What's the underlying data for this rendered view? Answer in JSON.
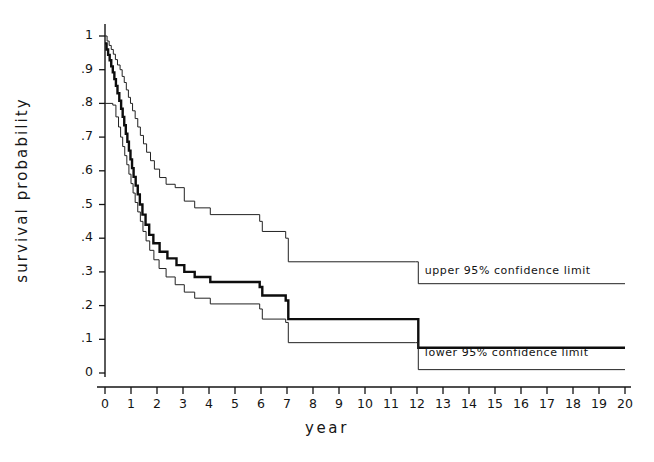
{
  "chart_data": {
    "type": "line",
    "title": "",
    "xlabel": "year",
    "ylabel": "survival probability",
    "xlim": [
      0,
      20
    ],
    "ylim": [
      0,
      1
    ],
    "grid": false,
    "legend_position": "inline-annotations",
    "x_ticks": [
      "0",
      "1",
      "2",
      "3",
      "4",
      "5",
      "6",
      "7",
      "8",
      "9",
      "10",
      "11",
      "12",
      "13",
      "14",
      "15",
      "16",
      "17",
      "18",
      "19",
      "20"
    ],
    "y_ticks": [
      "0",
      ".1",
      ".2",
      ".3",
      ".4",
      ".5",
      ".6",
      ".7",
      ".8",
      ".9",
      "1"
    ],
    "annotations": [
      {
        "text": "upper 95% confidence limit",
        "x": 12.3,
        "y": 0.3
      },
      {
        "text": "lower 95% confidence limit",
        "x": 12.3,
        "y": 0.055
      }
    ],
    "series": [
      {
        "name": "upper 95% confidence limit",
        "style": "step",
        "linewidth": 1,
        "color": "#222222",
        "points": [
          [
            0.0,
            1.0
          ],
          [
            0.08,
            0.985
          ],
          [
            0.16,
            0.972
          ],
          [
            0.24,
            0.96
          ],
          [
            0.32,
            0.946
          ],
          [
            0.4,
            0.93
          ],
          [
            0.48,
            0.914
          ],
          [
            0.58,
            0.9
          ],
          [
            0.66,
            0.88
          ],
          [
            0.74,
            0.862
          ],
          [
            0.82,
            0.84
          ],
          [
            0.9,
            0.818
          ],
          [
            0.98,
            0.8
          ],
          [
            1.06,
            0.778
          ],
          [
            1.16,
            0.755
          ],
          [
            1.26,
            0.73
          ],
          [
            1.36,
            0.705
          ],
          [
            1.48,
            0.68
          ],
          [
            1.6,
            0.655
          ],
          [
            1.75,
            0.63
          ],
          [
            1.9,
            0.605
          ],
          [
            2.1,
            0.58
          ],
          [
            2.35,
            0.56
          ],
          [
            2.7,
            0.55
          ],
          [
            3.05,
            0.51
          ],
          [
            3.45,
            0.49
          ],
          [
            4.05,
            0.47
          ],
          [
            5.95,
            0.45
          ],
          [
            6.05,
            0.42
          ],
          [
            6.95,
            0.4
          ],
          [
            7.05,
            0.33
          ],
          [
            11.95,
            0.33
          ],
          [
            12.05,
            0.265
          ],
          [
            20.0,
            0.265
          ]
        ]
      },
      {
        "name": "survival estimate",
        "style": "step",
        "linewidth": 2.4,
        "color": "#0d0d0d",
        "points": [
          [
            0.0,
            0.978
          ],
          [
            0.06,
            0.96
          ],
          [
            0.12,
            0.944
          ],
          [
            0.18,
            0.928
          ],
          [
            0.24,
            0.91
          ],
          [
            0.3,
            0.892
          ],
          [
            0.36,
            0.872
          ],
          [
            0.42,
            0.852
          ],
          [
            0.48,
            0.83
          ],
          [
            0.55,
            0.808
          ],
          [
            0.62,
            0.784
          ],
          [
            0.68,
            0.76
          ],
          [
            0.74,
            0.735
          ],
          [
            0.8,
            0.71
          ],
          [
            0.86,
            0.686
          ],
          [
            0.92,
            0.66
          ],
          [
            0.98,
            0.634
          ],
          [
            1.04,
            0.608
          ],
          [
            1.1,
            0.582
          ],
          [
            1.18,
            0.556
          ],
          [
            1.26,
            0.53
          ],
          [
            1.34,
            0.5
          ],
          [
            1.44,
            0.47
          ],
          [
            1.56,
            0.44
          ],
          [
            1.7,
            0.41
          ],
          [
            1.86,
            0.385
          ],
          [
            2.1,
            0.36
          ],
          [
            2.4,
            0.34
          ],
          [
            2.75,
            0.32
          ],
          [
            3.05,
            0.3
          ],
          [
            3.45,
            0.285
          ],
          [
            4.05,
            0.27
          ],
          [
            5.95,
            0.255
          ],
          [
            6.05,
            0.23
          ],
          [
            6.95,
            0.215
          ],
          [
            7.05,
            0.16
          ],
          [
            11.95,
            0.16
          ],
          [
            12.05,
            0.075
          ],
          [
            20.0,
            0.075
          ]
        ]
      },
      {
        "name": "lower 95% confidence limit",
        "style": "step",
        "linewidth": 1,
        "color": "#222222",
        "points": [
          [
            0.0,
            0.8
          ],
          [
            0.3,
            0.795
          ],
          [
            0.42,
            0.76
          ],
          [
            0.52,
            0.73
          ],
          [
            0.6,
            0.7
          ],
          [
            0.68,
            0.672
          ],
          [
            0.76,
            0.645
          ],
          [
            0.84,
            0.618
          ],
          [
            0.92,
            0.59
          ],
          [
            1.0,
            0.562
          ],
          [
            1.08,
            0.534
          ],
          [
            1.16,
            0.506
          ],
          [
            1.26,
            0.478
          ],
          [
            1.36,
            0.45
          ],
          [
            1.46,
            0.42
          ],
          [
            1.58,
            0.392
          ],
          [
            1.72,
            0.364
          ],
          [
            1.88,
            0.336
          ],
          [
            2.08,
            0.31
          ],
          [
            2.35,
            0.285
          ],
          [
            2.7,
            0.262
          ],
          [
            3.05,
            0.24
          ],
          [
            3.45,
            0.222
          ],
          [
            4.05,
            0.205
          ],
          [
            5.95,
            0.19
          ],
          [
            6.05,
            0.16
          ],
          [
            6.95,
            0.15
          ],
          [
            7.05,
            0.09
          ],
          [
            11.95,
            0.09
          ],
          [
            12.05,
            0.01
          ],
          [
            20.0,
            0.01
          ]
        ]
      }
    ]
  },
  "axes": {
    "x_axis_name": "year-axis",
    "y_axis_name": "survival-probability-axis"
  }
}
